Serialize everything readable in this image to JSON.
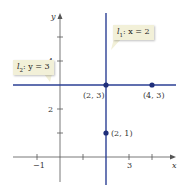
{
  "diagram": {
    "axes": {
      "x_label": "x",
      "y_label": "y",
      "x_ticks": [
        {
          "value": -1,
          "label": "−1"
        },
        {
          "value": 1,
          "label": ""
        },
        {
          "value": 2,
          "label": ""
        },
        {
          "value": 3,
          "label": "3"
        },
        {
          "value": 4,
          "label": ""
        }
      ],
      "y_ticks": [
        {
          "value": 1,
          "label": ""
        },
        {
          "value": 2,
          "label": "2"
        },
        {
          "value": 3,
          "label": ""
        },
        {
          "value": 4,
          "label": "4"
        },
        {
          "value": 5,
          "label": ""
        }
      ]
    },
    "lines": [
      {
        "name": "l1",
        "equation": "x = 2",
        "label_prefix": "l",
        "label_sub": "1",
        "label_rest": ": x = 2",
        "orientation": "vertical",
        "color": "#2b3f94"
      },
      {
        "name": "l2",
        "equation": "y = 3",
        "label_prefix": "l",
        "label_sub": "2",
        "label_rest": ": y = 3",
        "orientation": "horizontal",
        "color": "#2b3f94"
      }
    ],
    "points": [
      {
        "label": "(2, 3)",
        "x": 2,
        "y": 3
      },
      {
        "label": "(4, 3)",
        "x": 4,
        "y": 3
      },
      {
        "label": "(2, 1)",
        "x": 2,
        "y": 1
      }
    ],
    "colors": {
      "line": "#2b3f94",
      "callout_bg": "#f2f0d8",
      "axis": "#555555"
    }
  }
}
